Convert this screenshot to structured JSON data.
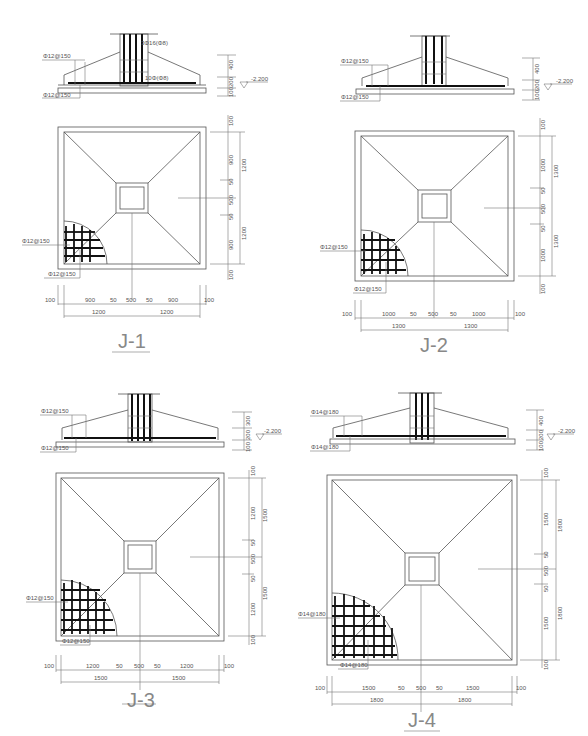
{
  "drawing": {
    "footings": [
      {
        "id": "J-1",
        "label": "J-1",
        "section": {
          "top_rebar_label": "Φ12@150",
          "bottom_rebar_label": "Φ12@150",
          "column_rebar_label": "3Φ16(Φ8)",
          "stirrup_label": "10Φ(Φ8)",
          "dim_100_label": "100",
          "heights": [
            "400",
            "200",
            "100"
          ],
          "elevation": "-2.200"
        },
        "plan": {
          "rebar_x_label": "Φ12@150",
          "rebar_y_label": "Φ12@150",
          "right_dims": [
            "100",
            "900",
            "50",
            "500",
            "50",
            "900",
            "100"
          ],
          "right_totals": [
            "1200",
            "1200"
          ],
          "bottom_dims": [
            "100",
            "900",
            "50",
            "500",
            "50",
            "900",
            "100"
          ],
          "bottom_totals": [
            "1200",
            "1200"
          ]
        }
      },
      {
        "id": "J-2",
        "label": "J-2",
        "section": {
          "top_rebar_label": "Φ12@150",
          "bottom_rebar_label": "Φ12@150",
          "heights": [
            "400",
            "200",
            "100"
          ],
          "elevation": "-2.200"
        },
        "plan": {
          "rebar_x_label": "Φ12@150",
          "rebar_y_label": "Φ12@150",
          "right_dims": [
            "100",
            "1000",
            "50",
            "500",
            "50",
            "1000",
            "100"
          ],
          "right_totals": [
            "1300",
            "1300"
          ],
          "bottom_dims": [
            "100",
            "1000",
            "50",
            "500",
            "50",
            "1000",
            "100"
          ],
          "bottom_totals": [
            "1300",
            "1300"
          ]
        }
      },
      {
        "id": "J-3",
        "label": "J-3",
        "section": {
          "top_rebar_label": "Φ12@150",
          "bottom_rebar_label": "Φ12@150",
          "heights": [
            "300",
            "200",
            "100"
          ],
          "elevation": "-2.200"
        },
        "plan": {
          "rebar_x_label": "Φ12@150",
          "rebar_y_label": "Φ12@150",
          "right_dims": [
            "100",
            "1200",
            "50",
            "500",
            "50",
            "1200",
            "100"
          ],
          "right_totals": [
            "1500",
            "1500"
          ],
          "bottom_dims": [
            "100",
            "1200",
            "50",
            "500",
            "50",
            "1200",
            "100"
          ],
          "bottom_totals": [
            "1500",
            "1500"
          ]
        }
      },
      {
        "id": "J-4",
        "label": "J-4",
        "section": {
          "top_rebar_label": "Φ14@180",
          "bottom_rebar_label": "Φ14@180",
          "heights": [
            "400",
            "200",
            "100"
          ],
          "elevation": "-2.200"
        },
        "plan": {
          "rebar_x_label": "Φ14@180",
          "rebar_y_label": "Φ14@180",
          "right_dims": [
            "100",
            "1500",
            "50",
            "500",
            "50",
            "1500",
            "100"
          ],
          "right_totals": [
            "1800",
            "1800"
          ],
          "bottom_dims": [
            "100",
            "1500",
            "50",
            "500",
            "50",
            "1500",
            "100"
          ],
          "bottom_totals": [
            "1800",
            "1800"
          ]
        }
      }
    ]
  }
}
